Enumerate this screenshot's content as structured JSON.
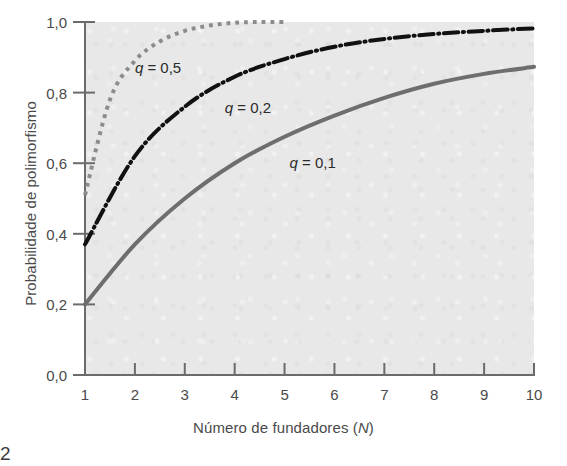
{
  "figure": {
    "page_number": "2",
    "background_color": "#ffffff",
    "plot_background_color": "#e8e8e8"
  },
  "axis": {
    "x_title_prefix": "Número de fundadores (",
    "x_title_symbol": "N",
    "x_title_suffix": ")",
    "y_title": "Probabilidade de polimorfismo",
    "tick_color": "#4a4a4a",
    "axis_color": "#6b6b6b"
  },
  "chart_data": {
    "type": "line",
    "title": "",
    "subtitle": "",
    "xlabel": "Número de fundadores (N)",
    "ylabel": "Probabilidade de polimorfismo",
    "xlim": [
      1,
      10
    ],
    "ylim": [
      0.0,
      1.0
    ],
    "grid": false,
    "legend_position": "inline-annotations",
    "xticks": [
      1,
      2,
      3,
      4,
      5,
      6,
      7,
      8,
      9,
      10
    ],
    "xtick_labels": [
      "1",
      "2",
      "3",
      "4",
      "5",
      "6",
      "7",
      "8",
      "9",
      "10"
    ],
    "yticks": [
      0.0,
      0.2,
      0.4,
      0.6,
      0.8,
      1.0
    ],
    "ytick_labels": [
      "0,0",
      "0,2",
      "0,4",
      "0,6",
      "0,8",
      "1,0"
    ],
    "x": [
      1,
      2,
      3,
      4,
      5,
      6,
      7,
      8,
      9,
      10
    ],
    "series": [
      {
        "name": "q = 0,5",
        "label": "q = 0,5",
        "label_symbol": "q",
        "label_value": "= 0,5",
        "style": "dotted",
        "color": "#8c8c8c",
        "width": 4,
        "x": [
          1,
          1.5,
          2,
          2.5,
          3,
          3.5,
          4,
          4.5,
          5
        ],
        "values": [
          0.51,
          0.78,
          0.89,
          0.945,
          0.975,
          0.99,
          0.998,
          1.0,
          1.0
        ],
        "label_x": 2.0,
        "label_y": 0.87
      },
      {
        "name": "q = 0,2",
        "label": "q = 0,2",
        "label_symbol": "q",
        "label_value": "= 0,2",
        "style": "dash-dot",
        "color": "#111111",
        "width": 4,
        "x": [
          1,
          2,
          3,
          4,
          5,
          6,
          7,
          8,
          9,
          10
        ],
        "values": [
          0.37,
          0.62,
          0.76,
          0.845,
          0.895,
          0.93,
          0.952,
          0.966,
          0.975,
          0.982
        ],
        "label_x": 3.8,
        "label_y": 0.755
      },
      {
        "name": "q = 0,1",
        "label": "q = 0,1",
        "label_symbol": "q",
        "label_value": "= 0,1",
        "style": "solid",
        "color": "#6e6e6e",
        "width": 4,
        "x": [
          1,
          2,
          3,
          4,
          5,
          6,
          7,
          8,
          9,
          10
        ],
        "values": [
          0.2,
          0.37,
          0.5,
          0.6,
          0.675,
          0.735,
          0.785,
          0.825,
          0.853,
          0.873
        ],
        "label_x": 5.1,
        "label_y": 0.6
      }
    ]
  }
}
